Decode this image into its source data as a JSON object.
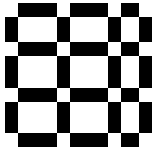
{
  "image": {
    "title": "Hermann grid illusion pattern",
    "kind": "illusion-grid",
    "width": 154,
    "height": 158,
    "background_color": "#ffffff",
    "bar_color": "#000000",
    "node_color": "#ffffff",
    "description": "Inverted Hermann / scintillating grid: black lattice bars over white field with small white squares at each bar intersection",
    "alt_text": "Black and white checkered grid pattern with white squares at the intersections of the black bars"
  },
  "grid": {
    "rows": 4,
    "columns": 4,
    "cells_visible": 9,
    "bar_thickness": 13,
    "node_size": 13,
    "vertical_bars": [
      {
        "name": "v-bar-1",
        "x": 5,
        "y": 0,
        "w": 13,
        "h": 158
      },
      {
        "name": "v-bar-2",
        "x": 57,
        "y": 0,
        "w": 13,
        "h": 158
      },
      {
        "name": "v-bar-3",
        "x": 108,
        "y": 0,
        "w": 13,
        "h": 158
      },
      {
        "name": "v-bar-4",
        "x": 139,
        "y": 0,
        "w": 13,
        "h": 158
      }
    ],
    "horizontal_bars": [
      {
        "name": "h-bar-1",
        "x": 0,
        "y": 3,
        "w": 154,
        "h": 14
      },
      {
        "name": "h-bar-2",
        "x": 0,
        "y": 42,
        "w": 154,
        "h": 14
      },
      {
        "name": "h-bar-3",
        "x": 0,
        "y": 88,
        "w": 154,
        "h": 14
      },
      {
        "name": "h-bar-4",
        "x": 0,
        "y": 133,
        "w": 154,
        "h": 14
      }
    ],
    "intersection_nodes": [
      {
        "name": "node-r1-c1",
        "x": 5,
        "y": 3,
        "w": 13,
        "h": 14
      },
      {
        "name": "node-r1-c2",
        "x": 57,
        "y": 3,
        "w": 13,
        "h": 14
      },
      {
        "name": "node-r1-c3",
        "x": 108,
        "y": 3,
        "w": 13,
        "h": 14
      },
      {
        "name": "node-r1-c4",
        "x": 139,
        "y": 3,
        "w": 13,
        "h": 14
      },
      {
        "name": "node-r2-c1",
        "x": 5,
        "y": 42,
        "w": 13,
        "h": 14
      },
      {
        "name": "node-r2-c2",
        "x": 57,
        "y": 42,
        "w": 13,
        "h": 14
      },
      {
        "name": "node-r2-c3",
        "x": 108,
        "y": 42,
        "w": 13,
        "h": 14
      },
      {
        "name": "node-r2-c4",
        "x": 139,
        "y": 42,
        "w": 13,
        "h": 14
      },
      {
        "name": "node-r3-c1",
        "x": 5,
        "y": 88,
        "w": 13,
        "h": 14
      },
      {
        "name": "node-r3-c2",
        "x": 57,
        "y": 88,
        "w": 13,
        "h": 14
      },
      {
        "name": "node-r3-c3",
        "x": 108,
        "y": 88,
        "w": 13,
        "h": 14
      },
      {
        "name": "node-r3-c4",
        "x": 139,
        "y": 88,
        "w": 13,
        "h": 14
      },
      {
        "name": "node-r4-c1",
        "x": 5,
        "y": 133,
        "w": 13,
        "h": 14
      },
      {
        "name": "node-r4-c2",
        "x": 57,
        "y": 133,
        "w": 13,
        "h": 14
      },
      {
        "name": "node-r4-c3",
        "x": 108,
        "y": 133,
        "w": 13,
        "h": 14
      },
      {
        "name": "node-r4-c4",
        "x": 139,
        "y": 133,
        "w": 13,
        "h": 14
      }
    ],
    "margin_patches": [
      {
        "name": "patch-top-margin",
        "x": 0,
        "y": 0,
        "w": 154,
        "h": 3
      },
      {
        "name": "patch-left-margin",
        "x": 0,
        "y": 0,
        "w": 5,
        "h": 158
      },
      {
        "name": "patch-bottom-margin",
        "x": 0,
        "y": 147,
        "w": 154,
        "h": 4
      },
      {
        "name": "patch-right-margin",
        "x": 152,
        "y": 0,
        "w": 2,
        "h": 158
      },
      {
        "name": "patch-bottom-strip",
        "x": 0,
        "y": 151,
        "w": 154,
        "h": 7
      }
    ]
  }
}
